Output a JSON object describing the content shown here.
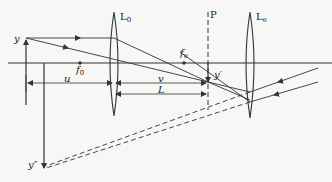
{
  "diagram": {
    "type": "optical-ray-diagram",
    "colors": {
      "line": "#333333",
      "background": "#f7f7f5"
    },
    "labels": {
      "object": "y",
      "objective_lens": "L",
      "objective_lens_sub": "0",
      "objective_focus": "f",
      "objective_focus_sub": "0",
      "eyepiece_focus": "f",
      "eyepiece_focus_sub": "e",
      "image_plane": "P",
      "eyepiece_lens": "L",
      "eyepiece_lens_sub": "e",
      "intermediate_image": "y′",
      "final_image": "y″",
      "object_distance": "u",
      "image_distance": "v",
      "length": "L"
    },
    "elements": [
      {
        "name": "optical-axis",
        "kind": "line"
      },
      {
        "name": "object-arrow-y",
        "kind": "arrow",
        "direction": "up"
      },
      {
        "name": "objective-lens-L0",
        "kind": "lens"
      },
      {
        "name": "image-plane-P",
        "kind": "dashed-line"
      },
      {
        "name": "eyepiece-lens-Le",
        "kind": "lens"
      },
      {
        "name": "intermediate-image-y-prime",
        "kind": "arrow",
        "direction": "down"
      },
      {
        "name": "final-virtual-image-y-double-prime",
        "kind": "arrow",
        "direction": "down"
      },
      {
        "name": "dimension-u",
        "kind": "dimension"
      },
      {
        "name": "dimension-v",
        "kind": "dimension"
      },
      {
        "name": "dimension-L",
        "kind": "dimension"
      }
    ]
  }
}
